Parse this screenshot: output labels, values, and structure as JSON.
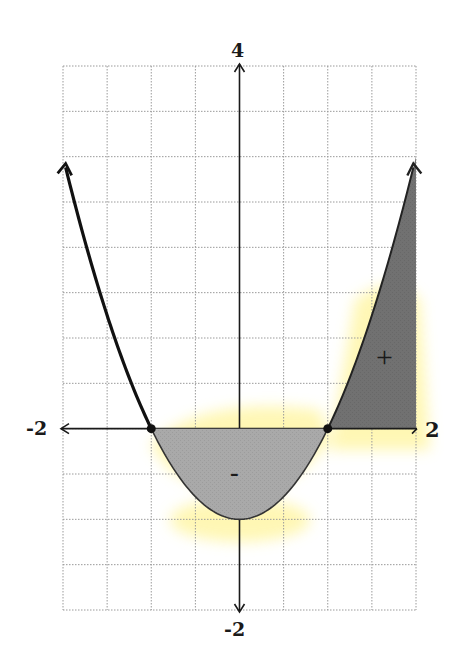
{
  "chart_data": {
    "type": "line",
    "function": "y = x^2 - 1",
    "title": "",
    "xlabel": "",
    "ylabel": "",
    "xlim": [
      -2,
      2
    ],
    "ylim": [
      -2,
      4
    ],
    "grid": true,
    "grid_step": 0.5,
    "tick_labels": {
      "x_min": "-2",
      "x_max": "2",
      "y_max": "4",
      "y_min": "-2"
    },
    "x": [
      -2,
      -1.5,
      -1,
      -0.5,
      0,
      0.5,
      1,
      1.5,
      2
    ],
    "values": [
      3,
      1.25,
      0,
      -0.75,
      -1,
      -0.75,
      0,
      1.25,
      3
    ],
    "roots": [
      [
        -1,
        0
      ],
      [
        1,
        0
      ]
    ],
    "vertex": [
      0,
      -1
    ],
    "shaded_regions": [
      {
        "from": -1,
        "to": 1,
        "sign": "-",
        "color": "#a9a9a9"
      },
      {
        "from": 1,
        "to": 2,
        "sign": "+",
        "color": "#717171"
      }
    ],
    "annotations": [
      "-",
      "+"
    ]
  },
  "colors": {
    "curve": "#111111",
    "grid": "#9a9a9a",
    "negative_fill": "#a9a9a9",
    "positive_fill": "#717171",
    "highlight": "#fff6a8"
  }
}
